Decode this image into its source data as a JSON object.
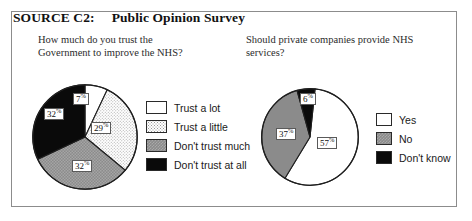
{
  "source": {
    "label": "SOURCE C2:",
    "title": "Public Opinion Survey"
  },
  "questions": {
    "left": "How much do you trust the\nGovernment to improve the NHS?",
    "right": "Should private companies provide NHS\nservices?"
  },
  "chart_data": [
    {
      "type": "pie",
      "title": "How much do you trust the Government to improve the NHS?",
      "legend_position": "right",
      "categories": [
        "Trust a lot",
        "Trust a little",
        "Don't trust much",
        "Don't trust at all"
      ],
      "values": [
        7,
        29,
        32,
        32
      ],
      "value_labels": [
        "7%",
        "29%",
        "32%",
        "32%"
      ],
      "unit": "percent",
      "colors": [
        "#ffffff",
        "#f0f0f0",
        "#8b8b8b",
        "#0a0a0a"
      ],
      "fill_styles": [
        "solid-white",
        "dotted-light",
        "hatched-gray",
        "solid-black"
      ]
    },
    {
      "type": "pie",
      "title": "Should private companies provide NHS services?",
      "legend_position": "right",
      "categories": [
        "Yes",
        "No",
        "Don't know"
      ],
      "values": [
        57,
        37,
        6
      ],
      "value_labels": [
        "57%",
        "37%",
        "6%"
      ],
      "unit": "percent",
      "colors": [
        "#ffffff",
        "#8b8b8b",
        "#0a0a0a"
      ],
      "fill_styles": [
        "solid-white",
        "hatched-gray",
        "solid-black"
      ]
    }
  ],
  "legend_left": [
    {
      "label": "Trust a lot",
      "swatch": "sw-white"
    },
    {
      "label": "Trust a little",
      "swatch": "sw-dot"
    },
    {
      "label": "Don't trust much",
      "swatch": "sw-gray"
    },
    {
      "label": "Don't trust at all",
      "swatch": "sw-black"
    }
  ],
  "legend_right": [
    {
      "label": "Yes",
      "swatch": "sw-white"
    },
    {
      "label": "No",
      "swatch": "sw-gray"
    },
    {
      "label": "Don't know",
      "swatch": "sw-black"
    }
  ],
  "pie_labels_left": [
    {
      "text": "7%",
      "x": 73,
      "y": 93
    },
    {
      "text": "29%",
      "x": 91,
      "y": 122
    },
    {
      "text": "32%",
      "x": 72,
      "y": 160
    },
    {
      "text": "32%",
      "x": 44,
      "y": 108
    }
  ],
  "pie_labels_right": [
    {
      "text": "57%",
      "x": 317,
      "y": 137
    },
    {
      "text": "37%",
      "x": 276,
      "y": 128
    },
    {
      "text": "6%",
      "x": 300,
      "y": 93
    }
  ],
  "colors": {
    "frame": "#8c8c8c",
    "ink": "#111111",
    "gray_fill": "#8b8b8b",
    "black_fill": "#0a0a0a",
    "white_fill": "#ffffff"
  }
}
